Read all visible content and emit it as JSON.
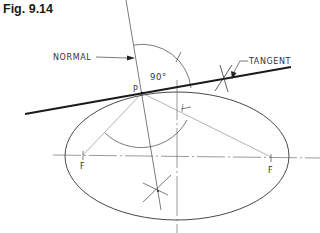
{
  "figure": {
    "title": "Fig. 9.14"
  },
  "labels": {
    "normal": "NORMAL",
    "tangent": "TANGENT",
    "angle": "90°",
    "point_p": "P",
    "focus_left": "F",
    "focus_right": "F"
  },
  "colors": {
    "ink": "#333333",
    "heavy_ink": "#1a1a1a",
    "background": "#ffffff"
  }
}
